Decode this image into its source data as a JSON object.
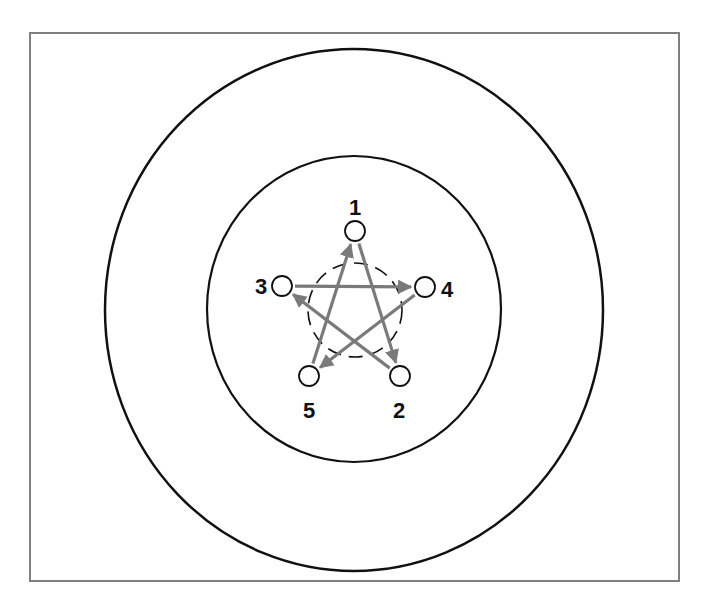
{
  "diagram": {
    "type": "network-pattern",
    "shape": "star-pentagram",
    "frame": {
      "x": 30,
      "y": 33,
      "width": 649,
      "height": 548,
      "stroke": "#808080"
    },
    "outer_ring": {
      "cx": 354,
      "cy": 310,
      "rx": 249,
      "ry": 261
    },
    "inner_ring": {
      "cx": 354,
      "cy": 309,
      "rx": 147,
      "ry": 153
    },
    "center_circle": {
      "cx": 355,
      "cy": 310,
      "r": 47,
      "style": "dashed"
    },
    "nodes": [
      {
        "id": "1",
        "label": "1",
        "cx": 355,
        "cy": 231,
        "lx": 355,
        "ly": 215
      },
      {
        "id": "2",
        "label": "2",
        "cx": 400,
        "cy": 376,
        "lx": 399,
        "ly": 418
      },
      {
        "id": "3",
        "label": "3",
        "cx": 282,
        "cy": 286,
        "lx": 261,
        "ly": 294
      },
      {
        "id": "4",
        "label": "4",
        "cx": 425,
        "cy": 287,
        "lx": 447,
        "ly": 297
      },
      {
        "id": "5",
        "label": "5",
        "cx": 309,
        "cy": 376,
        "lx": 309,
        "ly": 418
      }
    ],
    "edges": [
      {
        "from": "5",
        "to": "1"
      },
      {
        "from": "1",
        "to": "2"
      },
      {
        "from": "2",
        "to": "3"
      },
      {
        "from": "3",
        "to": "4"
      },
      {
        "from": "4",
        "to": "5"
      }
    ],
    "colors": {
      "ring": "#111111",
      "arrow": "#7a7a7a",
      "node_stroke": "#111111",
      "node_fill": "#ffffff"
    }
  }
}
